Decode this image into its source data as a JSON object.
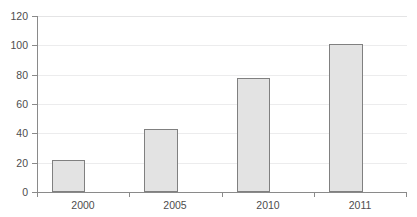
{
  "chart_data": {
    "type": "bar",
    "title": "",
    "xlabel": "",
    "ylabel": "",
    "categories": [
      "2000",
      "2005",
      "2010",
      "2011"
    ],
    "values": [
      22,
      43,
      78,
      101
    ],
    "ylim": [
      0,
      120
    ],
    "yticks": [
      0,
      20,
      40,
      60,
      80,
      100,
      120
    ],
    "ytick_labels": [
      "0",
      "20",
      "40",
      "60",
      "80",
      "100",
      "120"
    ],
    "grid": true,
    "legend": false,
    "series": [
      {
        "name": "",
        "values": [
          22,
          43,
          78,
          101
        ]
      }
    ],
    "colors": {
      "bar_fill": "#e3e3e3",
      "bar_border": "#808080",
      "gridline": "#ececed",
      "axis": "#8a8a8a",
      "text": "#4d4d4d",
      "background": "#ffffff"
    }
  }
}
